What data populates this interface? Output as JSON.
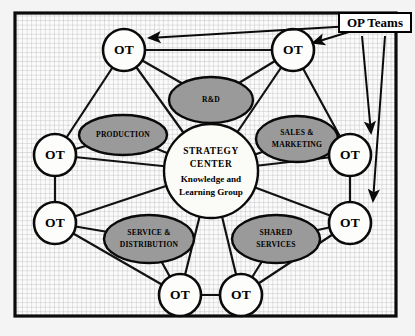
{
  "diagram": {
    "callout": {
      "label": "OP Teams"
    },
    "center": {
      "line1": "STRATEGY",
      "line2": "CENTER",
      "line3": "Knowledge and",
      "line4": "Learning Group"
    },
    "ot_nodes": [
      {
        "id": "ot-top-left",
        "label": "OT",
        "cx": 111,
        "cy": 39,
        "r": 21
      },
      {
        "id": "ot-top-right",
        "label": "OT",
        "cx": 280,
        "cy": 39,
        "r": 21
      },
      {
        "id": "ot-left-upper",
        "label": "OT",
        "cx": 42,
        "cy": 144,
        "r": 21
      },
      {
        "id": "ot-left-lower",
        "label": "OT",
        "cx": 42,
        "cy": 212,
        "r": 21
      },
      {
        "id": "ot-right-upper",
        "label": "OT",
        "cx": 337,
        "cy": 144,
        "r": 21
      },
      {
        "id": "ot-right-lower",
        "label": "OT",
        "cx": 337,
        "cy": 212,
        "r": 21
      },
      {
        "id": "ot-bottom-left",
        "label": "OT",
        "cx": 167,
        "cy": 284,
        "r": 21
      },
      {
        "id": "ot-bottom-right",
        "label": "OT",
        "cx": 228,
        "cy": 284,
        "r": 21
      }
    ],
    "function_nodes": [
      {
        "id": "rd",
        "lines": [
          "R&D"
        ],
        "cx": 198,
        "cy": 89,
        "rx": 42,
        "ry": 23
      },
      {
        "id": "production",
        "lines": [
          "PRODUCTION"
        ],
        "cx": 110,
        "cy": 124,
        "rx": 44,
        "ry": 20
      },
      {
        "id": "sales-marketing",
        "lines": [
          "SALES &",
          "MARKETING"
        ],
        "cx": 284,
        "cy": 128,
        "rx": 41,
        "ry": 23
      },
      {
        "id": "service-distribution",
        "lines": [
          "SERVICE &",
          "DISTRIBUTION"
        ],
        "cx": 136,
        "cy": 228,
        "rx": 45,
        "ry": 24
      },
      {
        "id": "shared-services",
        "lines": [
          "SHARED",
          "SERVICES"
        ],
        "cx": 263,
        "cy": 228,
        "rx": 44,
        "ry": 24
      }
    ],
    "colors": {
      "function_fill": "#9a9a9a",
      "node_fill": "#fdfdfb",
      "stroke": "#0a0a0a",
      "grid": "#b9b9b9",
      "page": "#f4f4f4"
    }
  }
}
